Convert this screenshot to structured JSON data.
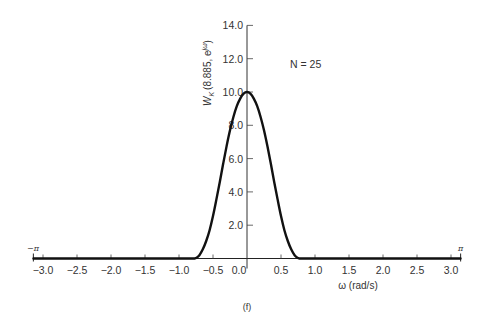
{
  "chart_data": {
    "type": "line",
    "title": "",
    "panel_label": "(f)",
    "annotation": "N = 25",
    "xlabel": "ω (rad/s)",
    "ylabel": "W_K(8.885, e^{jω})",
    "xlim": [
      -3.14159,
      3.14159
    ],
    "ylim": [
      0,
      14.0
    ],
    "x_ticks": [
      -3.0,
      -2.5,
      -2.0,
      -1.5,
      -1.0,
      -0.5,
      0.0,
      0.5,
      1.0,
      1.5,
      2.0,
      2.5,
      3.0
    ],
    "x_tick_labels": [
      "−3.0",
      "−2.5",
      "−2.0",
      "−1.5",
      "−1.0",
      "−0.5",
      "0.0",
      "0.5",
      "1.0",
      "1.5",
      "2.0",
      "2.5",
      "3.0"
    ],
    "x_end_labels": {
      "left": "−π",
      "right": "π"
    },
    "y_ticks": [
      2.0,
      4.0,
      6.0,
      8.0,
      10.0,
      12.0,
      14.0
    ],
    "y_tick_labels": [
      "2.0",
      "4.0",
      "6.0",
      "8.0",
      "10.0",
      "12.0",
      "14.0"
    ],
    "grid": false,
    "legend": null,
    "series": [
      {
        "name": "W_K(8.885, e^{jω})",
        "x": [
          -3.14,
          -1.0,
          -0.8,
          -0.75,
          -0.7,
          -0.65,
          -0.6,
          -0.55,
          -0.5,
          -0.45,
          -0.4,
          -0.35,
          -0.3,
          -0.25,
          -0.2,
          -0.15,
          -0.1,
          -0.05,
          0.0,
          0.05,
          0.1,
          0.15,
          0.2,
          0.25,
          0.3,
          0.35,
          0.4,
          0.45,
          0.5,
          0.55,
          0.6,
          0.65,
          0.7,
          0.75,
          0.8,
          1.0,
          3.14
        ],
        "values": [
          0,
          0,
          0,
          0.03,
          0.2,
          0.55,
          1.05,
          1.7,
          2.55,
          3.55,
          4.6,
          5.7,
          6.75,
          7.7,
          8.5,
          9.15,
          9.6,
          9.9,
          10.0,
          9.9,
          9.6,
          9.15,
          8.5,
          7.7,
          6.75,
          5.7,
          4.6,
          3.55,
          2.55,
          1.7,
          1.05,
          0.55,
          0.2,
          0.03,
          0,
          0,
          0
        ]
      }
    ]
  },
  "labels": {
    "annotation": "N = 25",
    "xlabel": "ω (rad/s)",
    "ylabel_main": "W",
    "ylabel_sub": "K",
    "ylabel_rest": "(8.885, e",
    "ylabel_sup": "jω",
    "ylabel_close": ")",
    "panel": "(f)",
    "neg_pi": "−π",
    "pos_pi": "π"
  }
}
